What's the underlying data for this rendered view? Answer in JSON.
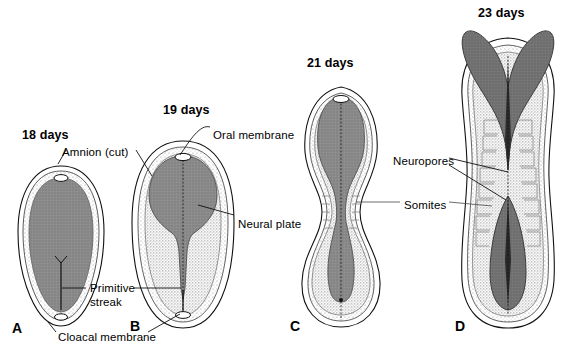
{
  "figure": {
    "background_color": "#ffffff",
    "ink_color": "#000000",
    "colors": {
      "neural_plate_fill": "#8a8a8a",
      "neural_fold_dark": "#6f6f6f",
      "embryonic_disc_stipple": "#c9c9c9",
      "amnion_outline": "#1a1a1a"
    }
  },
  "panels": [
    {
      "letter": "A",
      "day_label": "18 days",
      "letter_x": 12,
      "letter_y": 322,
      "day_x": 22,
      "day_y": 128
    },
    {
      "letter": "B",
      "day_label": "19 days",
      "letter_x": 130,
      "letter_y": 320,
      "day_x": 163,
      "day_y": 103
    },
    {
      "letter": "C",
      "day_label": "21 days",
      "letter_x": 290,
      "letter_y": 320,
      "day_x": 307,
      "day_y": 56
    },
    {
      "letter": "D",
      "day_label": "23 days",
      "letter_x": 455,
      "letter_y": 320,
      "day_x": 478,
      "day_y": 6
    }
  ],
  "annotations": [
    {
      "id": "amnion",
      "text": "Amnion (cut)",
      "x": 62,
      "y": 146
    },
    {
      "id": "oral-membrane",
      "text": "Oral membrane",
      "x": 213,
      "y": 129
    },
    {
      "id": "neural-plate",
      "text": "Neural plate",
      "x": 238,
      "y": 218
    },
    {
      "id": "primitive-streak-line1",
      "text": "Primitive",
      "x": 90,
      "y": 288
    },
    {
      "id": "primitive-streak-line2",
      "text": "streak",
      "x": 90,
      "y": 301
    },
    {
      "id": "cloacal-membrane",
      "text": "Cloacal membrane",
      "x": 58,
      "y": 337
    },
    {
      "id": "neuropores",
      "text": "Neuropores",
      "x": 393,
      "y": 161
    },
    {
      "id": "somites",
      "text": "Somites",
      "x": 404,
      "y": 205
    }
  ]
}
